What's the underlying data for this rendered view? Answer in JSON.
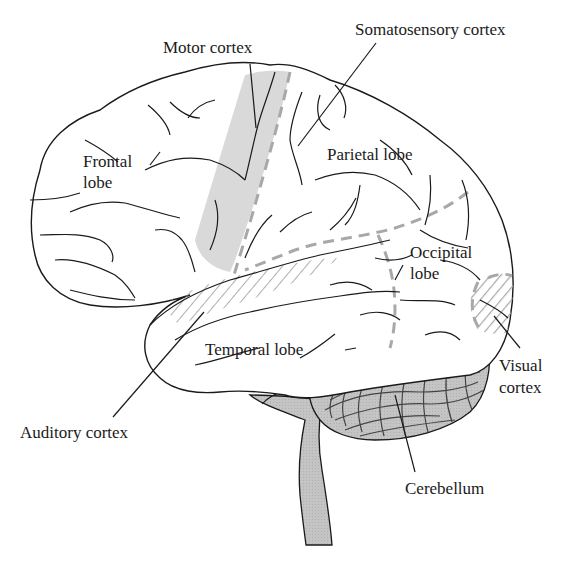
{
  "diagram": {
    "type": "anatomical-illustration",
    "colors": {
      "outline": "#1a1a1a",
      "motor_cortex_fill": "#d9d9d9",
      "boundary_dashes": "#a8a8a8",
      "hatching": "#9a9a9a",
      "cerebellum_fill": "#c2c2c2",
      "brainstem_fill": "#cfcfcf",
      "background": "#ffffff"
    },
    "labels": {
      "motor_cortex": "Motor cortex",
      "somatosensory_cortex": "Somatosensory cortex",
      "frontal_lobe_line1": "Frontal",
      "frontal_lobe_line2": "lobe",
      "parietal_lobe": "Parietal lobe",
      "occipital_lobe_line1": "Occipital",
      "occipital_lobe_line2": "lobe",
      "temporal_lobe": "Temporal lobe",
      "visual_cortex_line1": "Visual",
      "visual_cortex_line2": "cortex",
      "auditory_cortex": "Auditory cortex",
      "cerebellum": "Cerebellum"
    }
  }
}
